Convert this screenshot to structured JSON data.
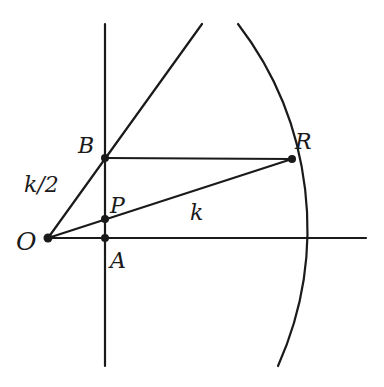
{
  "diagram": {
    "stroke_color": "#1a1a1a",
    "background": "#ffffff",
    "points": {
      "O": {
        "label": "O",
        "x": 48,
        "y": 238
      },
      "A": {
        "label": "A",
        "x": 105,
        "y": 238
      },
      "P": {
        "label": "P",
        "x": 105,
        "y": 219
      },
      "B": {
        "label": "B",
        "x": 105,
        "y": 158
      },
      "R": {
        "label": "R",
        "x": 292,
        "y": 159
      }
    },
    "segment_labels": {
      "OB": "k/2",
      "OR": "k"
    },
    "lines": [
      {
        "name": "vertical-line",
        "from": [
          105,
          24
        ],
        "to": [
          105,
          366
        ]
      },
      {
        "name": "horizontal-axis",
        "from": [
          48,
          238
        ],
        "to": [
          366,
          238
        ]
      },
      {
        "name": "ray-OB",
        "from": [
          48,
          238
        ],
        "to": [
          202,
          24
        ]
      },
      {
        "name": "segment-BR",
        "from": [
          105,
          158
        ],
        "to": [
          292,
          159
        ]
      },
      {
        "name": "segment-OR",
        "from": [
          48,
          238
        ],
        "to": [
          292,
          159
        ]
      }
    ],
    "arc": {
      "start": [
        238,
        24
      ],
      "end": [
        278,
        366
      ],
      "radius": 336
    }
  }
}
